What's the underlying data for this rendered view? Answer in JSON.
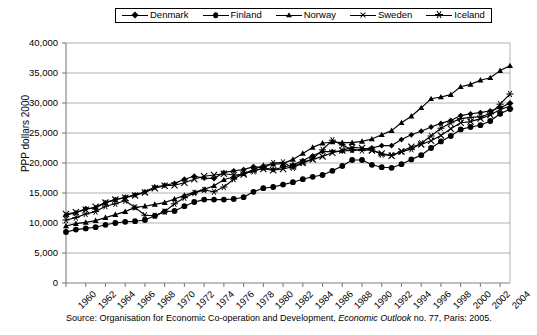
{
  "chart_data": {
    "type": "line",
    "title": "",
    "xlabel": "",
    "ylabel": "PPP dollars 2000",
    "ylim": [
      0,
      40000
    ],
    "ytick_labels": [
      "40,000",
      "35,000",
      "30,000",
      "25,000",
      "20,000",
      "15,000",
      "10,000",
      "5,000",
      "0"
    ],
    "ytick_values": [
      40000,
      35000,
      30000,
      25000,
      20000,
      15000,
      10000,
      5000,
      0
    ],
    "grid": true,
    "legend_position": "top-center",
    "x": [
      1960,
      1961,
      1962,
      1963,
      1964,
      1965,
      1966,
      1967,
      1968,
      1969,
      1970,
      1971,
      1972,
      1973,
      1974,
      1975,
      1976,
      1977,
      1978,
      1979,
      1980,
      1981,
      1982,
      1983,
      1984,
      1985,
      1986,
      1987,
      1988,
      1989,
      1990,
      1991,
      1992,
      1993,
      1994,
      1995,
      1996,
      1997,
      1998,
      1999,
      2000,
      2001,
      2002,
      2003,
      2004,
      2005
    ],
    "xtick_labels": [
      "1960",
      "1962",
      "1964",
      "1966",
      "1968",
      "1970",
      "1972",
      "1974",
      "1976",
      "1978",
      "1980",
      "1982",
      "1984",
      "1986",
      "1988",
      "1990",
      "1992",
      "1994",
      "1996",
      "1998",
      "2000",
      "2002",
      "2004"
    ],
    "xtick_values": [
      1960,
      1962,
      1964,
      1966,
      1968,
      1970,
      1972,
      1974,
      1976,
      1978,
      1980,
      1982,
      1984,
      1986,
      1988,
      1990,
      1992,
      1994,
      1996,
      1998,
      2000,
      2002,
      2004
    ],
    "series": [
      {
        "name": "Denmark",
        "marker": "diamond",
        "values": [
          11300,
          11700,
          12400,
          12500,
          13400,
          13900,
          14300,
          14700,
          15200,
          16000,
          16300,
          16600,
          17300,
          17800,
          17500,
          17400,
          18400,
          18700,
          18900,
          19400,
          19200,
          18900,
          19300,
          19700,
          20400,
          21200,
          21900,
          21900,
          22000,
          22100,
          22300,
          22500,
          22900,
          22900,
          23900,
          24700,
          25300,
          26000,
          26600,
          27100,
          27900,
          28200,
          28400,
          28700,
          29200,
          30000
        ]
      },
      {
        "name": "Finland",
        "marker": "circle",
        "values": [
          8500,
          8900,
          9100,
          9300,
          9700,
          10000,
          10200,
          10300,
          10500,
          11200,
          11900,
          12000,
          12800,
          13500,
          13900,
          13900,
          13900,
          14000,
          14300,
          15200,
          15800,
          16000,
          16400,
          16800,
          17300,
          17700,
          18000,
          18700,
          19500,
          20500,
          20500,
          19700,
          19300,
          19200,
          19800,
          20600,
          21300,
          22500,
          23600,
          24500,
          25600,
          26000,
          26300,
          27000,
          28200,
          29000
        ]
      },
      {
        "name": "Norway",
        "marker": "triangle",
        "values": [
          9500,
          9900,
          10100,
          10400,
          10900,
          11400,
          11900,
          12600,
          12800,
          13100,
          13400,
          14000,
          14600,
          15100,
          15600,
          16200,
          17200,
          17700,
          18200,
          18900,
          19600,
          19800,
          19900,
          20600,
          21600,
          22600,
          23300,
          23500,
          23400,
          23400,
          23600,
          24000,
          24700,
          25400,
          26700,
          27800,
          29200,
          30700,
          31000,
          31400,
          32700,
          33100,
          33800,
          34200,
          35400,
          36200
        ]
      },
      {
        "name": "Sweden",
        "marker": "x",
        "values": [
          11500,
          11800,
          12200,
          12700,
          13400,
          13900,
          14200,
          14600,
          15100,
          15800,
          16200,
          16300,
          16700,
          17300,
          17800,
          18000,
          18200,
          18000,
          18100,
          18800,
          19000,
          18800,
          19000,
          19400,
          20100,
          20600,
          21100,
          21700,
          22100,
          22600,
          22500,
          22100,
          21600,
          21200,
          21900,
          22700,
          23100,
          23700,
          24600,
          25700,
          26700,
          26900,
          27400,
          28000,
          28900,
          29500
        ]
      },
      {
        "name": "Iceland",
        "marker": "star",
        "values": [
          10500,
          10900,
          11500,
          11900,
          12800,
          13200,
          13700,
          12600,
          11300,
          11200,
          11900,
          13200,
          14200,
          15000,
          15500,
          15200,
          16000,
          17300,
          18300,
          18600,
          19200,
          20000,
          20100,
          19200,
          20000,
          20700,
          22200,
          23800,
          23000,
          22200,
          22100,
          22200,
          21400,
          21300,
          21900,
          22300,
          23300,
          24500,
          25800,
          26700,
          27400,
          27600,
          27700,
          28200,
          29800,
          31500
        ]
      }
    ]
  },
  "legend": {
    "items": [
      {
        "label": "Denmark",
        "marker": "diamond-marker"
      },
      {
        "label": "Finland",
        "marker": "circle-marker"
      },
      {
        "label": "Norway",
        "marker": "triangle-marker"
      },
      {
        "label": "Sweden",
        "marker": "x-marker"
      },
      {
        "label": "Iceland",
        "marker": "star-marker"
      }
    ]
  },
  "source": {
    "prefix": "Source: Organisation for Economic Co-operation and Development, ",
    "italic": "Economic Outlook",
    "suffix": " no. 77, Paris: 2005."
  },
  "colors": {
    "line": "#000000",
    "grid": "#a8a8a8",
    "axis": "#808080",
    "background": "#ffffff"
  }
}
